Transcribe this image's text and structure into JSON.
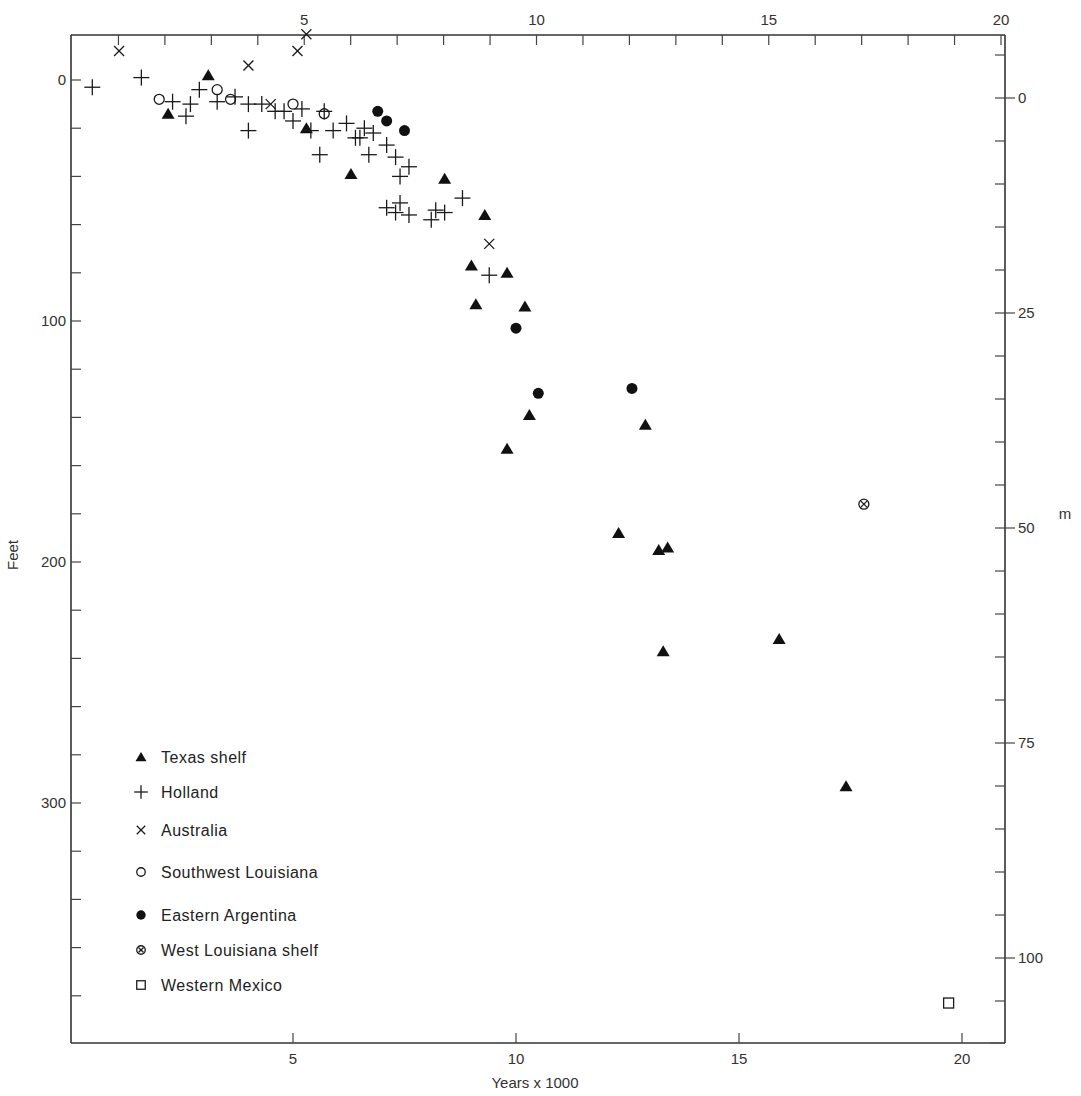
{
  "chart_data": {
    "type": "scatter",
    "title": "",
    "xlabel": "Years x 1000",
    "ylabel": "Feet",
    "ylabel_right": "m",
    "xlim": [
      0,
      20.6
    ],
    "ylim_feet": [
      -25,
      400
    ],
    "x_ticks_bottom": [
      5,
      10,
      15,
      20
    ],
    "x_ticks_top": [
      5,
      10,
      15,
      20
    ],
    "y_ticks_left": [
      0,
      100,
      200,
      300
    ],
    "y_ticks_right": [
      0,
      25,
      50,
      75,
      100
    ],
    "grid": false,
    "legend_position": "lower-left inside",
    "series": [
      {
        "name": "Texas shelf",
        "marker": "filled-triangle",
        "points": [
          [
            2.2,
            14
          ],
          [
            3.1,
            -2
          ],
          [
            5.3,
            20
          ],
          [
            6.3,
            39
          ],
          [
            8.4,
            41
          ],
          [
            9.3,
            56
          ],
          [
            9.0,
            77
          ],
          [
            9.8,
            80
          ],
          [
            9.1,
            93
          ],
          [
            10.2,
            94
          ],
          [
            10.3,
            139
          ],
          [
            9.8,
            153
          ],
          [
            12.9,
            143
          ],
          [
            12.3,
            188
          ],
          [
            13.2,
            195
          ],
          [
            13.4,
            194
          ],
          [
            13.3,
            237
          ],
          [
            15.9,
            232
          ],
          [
            17.4,
            293
          ]
        ]
      },
      {
        "name": "Holland",
        "marker": "plus",
        "points": [
          [
            0.5,
            3
          ],
          [
            1.6,
            -1
          ],
          [
            2.3,
            9
          ],
          [
            2.6,
            15
          ],
          [
            2.7,
            10
          ],
          [
            2.9,
            4
          ],
          [
            3.3,
            9
          ],
          [
            3.7,
            7
          ],
          [
            4.0,
            10
          ],
          [
            4.0,
            21
          ],
          [
            4.3,
            10
          ],
          [
            4.6,
            13
          ],
          [
            4.8,
            13
          ],
          [
            5.0,
            17
          ],
          [
            5.2,
            12
          ],
          [
            5.4,
            21
          ],
          [
            5.6,
            31
          ],
          [
            5.7,
            13
          ],
          [
            5.9,
            21
          ],
          [
            6.2,
            18
          ],
          [
            6.4,
            24
          ],
          [
            6.5,
            24
          ],
          [
            6.6,
            20
          ],
          [
            6.7,
            31
          ],
          [
            6.8,
            22
          ],
          [
            7.1,
            27
          ],
          [
            7.3,
            32
          ],
          [
            7.4,
            40
          ],
          [
            7.6,
            36
          ],
          [
            7.1,
            53
          ],
          [
            7.3,
            55
          ],
          [
            7.4,
            51
          ],
          [
            7.6,
            56
          ],
          [
            8.1,
            58
          ],
          [
            8.2,
            54
          ],
          [
            8.4,
            55
          ],
          [
            8.8,
            49
          ],
          [
            9.4,
            81
          ]
        ]
      },
      {
        "name": "Australia",
        "marker": "x",
        "points": [
          [
            1.1,
            -12
          ],
          [
            4.0,
            -6
          ],
          [
            4.5,
            10
          ],
          [
            5.1,
            -12
          ],
          [
            5.3,
            -19
          ],
          [
            9.4,
            68
          ]
        ]
      },
      {
        "name": "Southwest Louisiana",
        "marker": "open-circle",
        "points": [
          [
            2.0,
            8
          ],
          [
            3.3,
            4
          ],
          [
            3.6,
            8
          ],
          [
            5.0,
            10
          ],
          [
            5.7,
            14
          ]
        ]
      },
      {
        "name": "Eastern Argentina",
        "marker": "filled-circle",
        "points": [
          [
            6.9,
            13
          ],
          [
            7.1,
            17
          ],
          [
            7.5,
            21
          ],
          [
            10.0,
            103
          ],
          [
            10.5,
            130
          ],
          [
            12.6,
            128
          ]
        ]
      },
      {
        "name": "West Louisiana shelf",
        "marker": "circled-x",
        "points": [
          [
            17.8,
            176
          ]
        ]
      },
      {
        "name": "Western Mexico",
        "marker": "open-square",
        "points": [
          [
            19.7,
            383
          ]
        ]
      }
    ]
  },
  "axes": {
    "x_bottom_ticks": [
      "5",
      "10",
      "15",
      "20"
    ],
    "x_top_ticks": [
      "5",
      "10",
      "15",
      "20"
    ],
    "y_left_ticks": [
      "0",
      "100",
      "200",
      "300"
    ],
    "y_right_ticks": [
      "0",
      "25",
      "50",
      "75",
      "100"
    ],
    "x_title": "Years x 1000",
    "y_left_title": "Feet",
    "y_right_title": "m"
  },
  "legend": [
    {
      "label": "Texas shelf",
      "marker": "filled-triangle"
    },
    {
      "label": "Holland",
      "marker": "plus"
    },
    {
      "label": "Australia",
      "marker": "x"
    },
    {
      "label": "Southwest Louisiana",
      "marker": "open-circle"
    },
    {
      "label": "Eastern Argentina",
      "marker": "filled-circle"
    },
    {
      "label": "West Louisiana shelf",
      "marker": "circled-x"
    },
    {
      "label": "Western Mexico",
      "marker": "open-square"
    }
  ]
}
